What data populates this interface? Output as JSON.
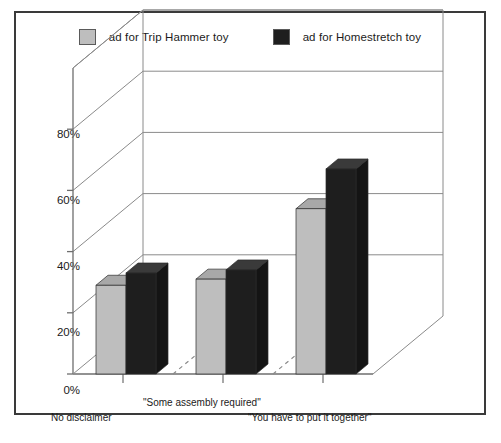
{
  "chart_data": {
    "type": "bar",
    "title": "",
    "subtitle": "",
    "xlabel": "",
    "ylabel": "",
    "grid": true,
    "legend_position": "top",
    "projection": "3d",
    "ylim": [
      0,
      100
    ],
    "yticks": [
      "0%",
      "20%",
      "40%",
      "60%",
      "80%"
    ],
    "ytick_values": [
      0,
      20,
      40,
      60,
      80
    ],
    "categories": [
      "No disclaimer",
      "\"Some assembly required\"",
      "\"You have to put it together\""
    ],
    "series": [
      {
        "name": "ad for Trip Hammer toy",
        "color": "#bebebe",
        "values": [
          29,
          31,
          54
        ]
      },
      {
        "name": "ad for Homestretch toy",
        "color": "#1e1e1e",
        "values": [
          33,
          34,
          67
        ]
      }
    ]
  },
  "legend": {
    "items": [
      {
        "label": "ad for Trip Hammer toy",
        "swatch_icon": "legend-swatch-light",
        "color": "#bebebe"
      },
      {
        "label": "ad for Homestretch toy",
        "swatch_icon": "legend-swatch-dark",
        "color": "#1e1e1e"
      }
    ]
  },
  "colors": {
    "frame_border": "#3a3a3a",
    "axis": "#6e6e6e",
    "gridline": "#8a8a8a",
    "bar_light_front": "#bebebe",
    "bar_light_top": "#a8a8a8",
    "bar_light_side": "#9a9a9a",
    "bar_dark_front": "#1e1e1e",
    "bar_dark_top": "#3a3a3a",
    "bar_dark_side": "#141414",
    "background": "#ffffff"
  }
}
